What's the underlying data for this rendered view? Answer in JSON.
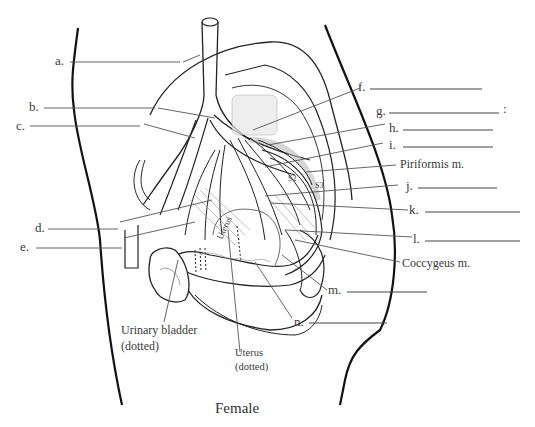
{
  "figure": {
    "caption": "Female"
  },
  "labels": [
    {
      "id": "a",
      "text": "a."
    },
    {
      "id": "b",
      "text": "b."
    },
    {
      "id": "c",
      "text": "c."
    },
    {
      "id": "d",
      "text": "d."
    },
    {
      "id": "e",
      "text": "e."
    },
    {
      "id": "f",
      "text": "f."
    },
    {
      "id": "g",
      "text": "g."
    },
    {
      "id": "g_colon",
      "text": ":"
    },
    {
      "id": "h",
      "text": "h."
    },
    {
      "id": "i",
      "text": "i."
    },
    {
      "id": "j",
      "text": "j."
    },
    {
      "id": "k",
      "text": "k."
    },
    {
      "id": "l",
      "text": "l."
    },
    {
      "id": "m",
      "text": "m."
    },
    {
      "id": "n",
      "text": "n."
    }
  ],
  "structures": {
    "piriformis": "Piriformis m.",
    "coccygeus": "Coccygeus m.",
    "urinary_bladder_line1": "Urinary bladder",
    "urinary_bladder_line2": "(dotted)",
    "uterus_line1": "Uterus",
    "uterus_line2": "(dotted)",
    "uterus_inner": "Uterus",
    "s2": "S2",
    "s3": "S3"
  }
}
